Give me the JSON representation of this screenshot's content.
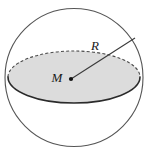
{
  "figure": {
    "name": "sphere-with-equatorial-disc",
    "background_color": "#ffffff",
    "width": 148,
    "height": 154
  },
  "sphere": {
    "name": "sphere-outline",
    "center_x": 74,
    "center_y": 77.5,
    "radius": 69,
    "stroke_color": "#555555",
    "stroke_width": 1.1,
    "fill": "none"
  },
  "disc": {
    "name": "equatorial-disc",
    "center_x": 74,
    "center_y": 77,
    "radius_x": 66,
    "radius_y": 26,
    "fill_color": "#dcdcdc",
    "front_arc_stroke": "#2b2b2b",
    "front_arc_width": 1.6,
    "back_arc_stroke": "#4a4a4a",
    "back_arc_width": 1.1,
    "back_arc_dash": "3,2.2"
  },
  "radius_segment": {
    "name": "radius-line",
    "from_x": 71,
    "from_y": 79,
    "to_x": 135,
    "to_y": 38,
    "stroke_color": "#3a3a3a",
    "stroke_width": 1.1
  },
  "center_point": {
    "name": "center-dot",
    "x": 71,
    "y": 79,
    "radius": 2.1,
    "color": "#111111"
  },
  "labels": {
    "center": {
      "text": "M",
      "x": 57,
      "y": 79,
      "font_size": 13
    },
    "radius": {
      "text": "R",
      "x": 95,
      "y": 47,
      "font_size": 13
    }
  }
}
